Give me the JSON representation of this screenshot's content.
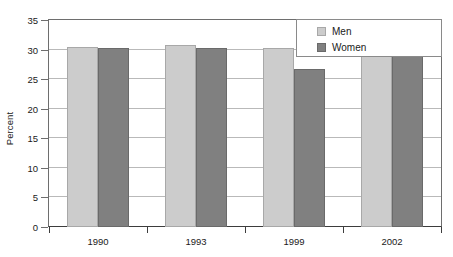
{
  "chart_data": {
    "type": "bar",
    "title": "",
    "xlabel": "",
    "ylabel": "Percent",
    "categories": [
      "1990",
      "1993",
      "1999",
      "2002"
    ],
    "series": [
      {
        "name": "Men",
        "color": "#cccccc",
        "values": [
          30.4,
          30.8,
          30.3,
          29.5
        ]
      },
      {
        "name": "Women",
        "color": "#808080",
        "values": [
          30.3,
          30.3,
          26.7,
          28.9
        ]
      }
    ],
    "ylim": [
      0,
      35
    ],
    "yticks": [
      0,
      5,
      10,
      15,
      20,
      25,
      30,
      35
    ],
    "ytick_labels": [
      "0",
      "5",
      "10",
      "15",
      "20",
      "25",
      "30",
      "35"
    ],
    "grid": true,
    "legend_position": "top-right",
    "legend_entries": [
      "Men",
      "Women"
    ]
  },
  "colors": {
    "men": "#cccccc",
    "women": "#808080",
    "grid": "#b9b9b9",
    "axis": "#3d3d3d",
    "frame": "#6e6e6e",
    "text": "#1a1a1a",
    "background": "#ffffff"
  }
}
